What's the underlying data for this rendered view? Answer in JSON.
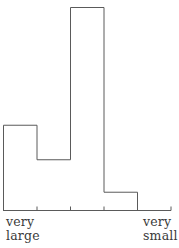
{
  "chart_data": {
    "type": "bar",
    "title": "",
    "xlabel": "",
    "ylabel": "",
    "categories": [
      "1",
      "2",
      "3",
      "4",
      "5"
    ],
    "values": [
      42,
      25,
      100,
      9,
      0
    ],
    "ylim": [
      0,
      100
    ],
    "grid": false,
    "legend": null,
    "style": "histogram outline (step), no fill, no y-axis",
    "x_axis_end_labels": {
      "left": "very large",
      "right": "very small"
    },
    "tick_count": 5
  },
  "labels": {
    "left_line1": "very",
    "left_line2": "large",
    "right_line1": "very",
    "right_line2": "small"
  },
  "colors": {
    "line": "#5a5a5a",
    "text": "#3a3a3a",
    "background": "#ffffff"
  }
}
